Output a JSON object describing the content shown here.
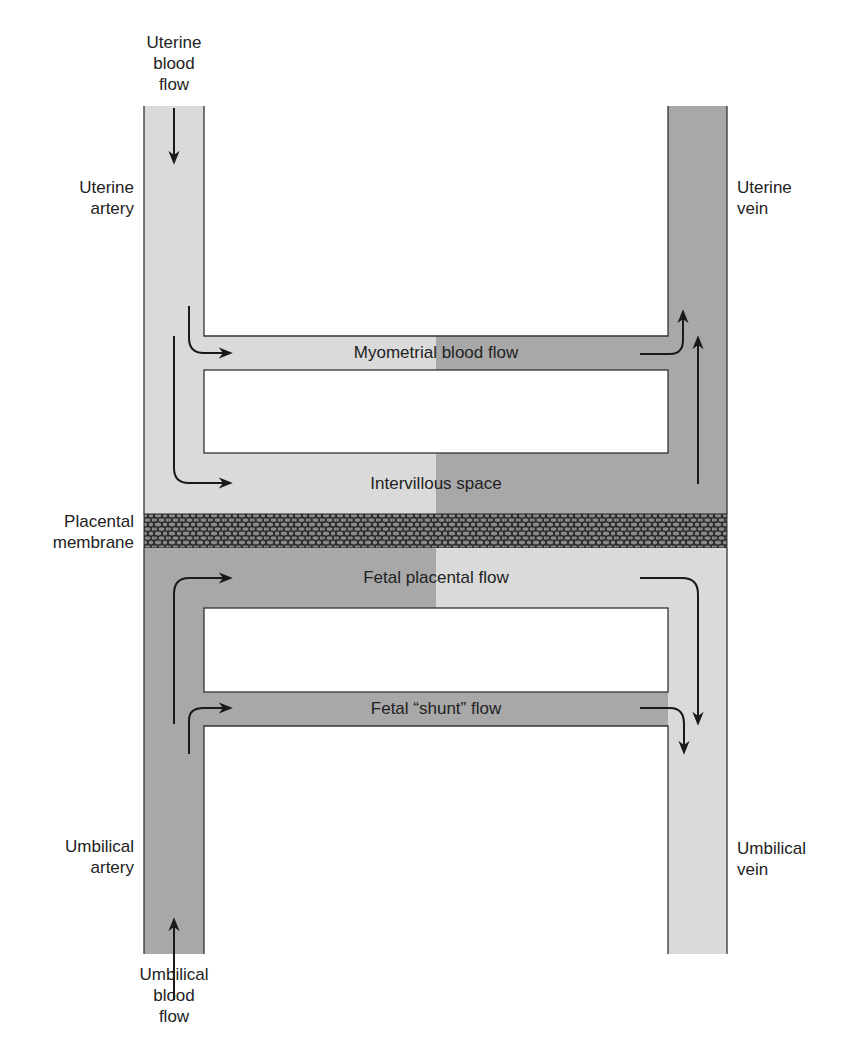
{
  "colors": {
    "light_blood": "#dadada",
    "dark_blood": "#a8a8a8",
    "outline": "#333333",
    "membrane_bg": "#2a2a2a",
    "membrane_cell": "#8a8a8a",
    "arrow": "#1a1a1a"
  },
  "labels": {
    "uterine_blood_flow": [
      "Uterine",
      "blood",
      "flow"
    ],
    "uterine_artery": [
      "Uterine",
      "artery"
    ],
    "uterine_vein": [
      "Uterine",
      "vein"
    ],
    "placental_membrane": [
      "Placental",
      "membrane"
    ],
    "umbilical_artery": [
      "Umbilical",
      "artery"
    ],
    "umbilical_vein": [
      "Umbilical",
      "vein"
    ],
    "umbilical_blood_flow": [
      "Umbilical",
      "blood",
      "flow"
    ]
  },
  "channels": {
    "myometrial": "Myometrial blood flow",
    "intervillous": "Intervillous space",
    "fetal_placental": "Fetal placental flow",
    "fetal_shunt": "Fetal “shunt” flow"
  }
}
